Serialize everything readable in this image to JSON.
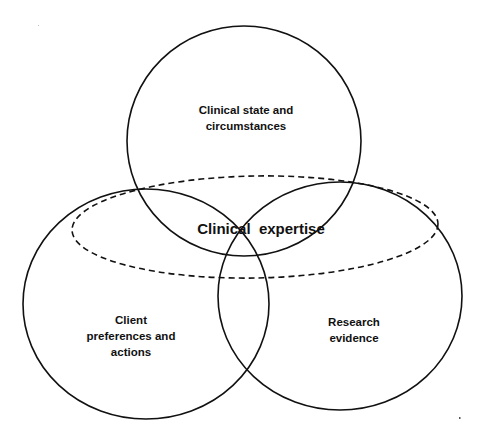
{
  "diagram": {
    "type": "venn",
    "sets": [
      {
        "id": "clinical_state",
        "lines": [
          "Clinical state and",
          "circumstances"
        ],
        "border": "solid"
      },
      {
        "id": "client_preferences",
        "lines": [
          "Client",
          "preferences and",
          "actions"
        ],
        "border": "solid"
      },
      {
        "id": "research_evidence",
        "lines": [
          "Research",
          "evidence"
        ],
        "border": "solid"
      },
      {
        "id": "clinical_expertise",
        "label": "Clinical  expertise",
        "border": "dashed",
        "encompasses": [
          "clinical_state",
          "client_preferences",
          "research_evidence"
        ]
      }
    ],
    "stroke_color": "#111111",
    "background": "#ffffff"
  }
}
